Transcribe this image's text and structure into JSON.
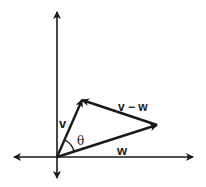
{
  "diagram": {
    "type": "vector-diagram",
    "colors": {
      "stroke": "#1a1a1a",
      "background": "#ffffff"
    },
    "axes": {
      "origin": [
        57,
        157
      ],
      "x_axis": {
        "left": 14,
        "right": 193
      },
      "y_axis": {
        "top": 12,
        "bottom": 178
      }
    },
    "vectors": [
      {
        "name": "v",
        "label": "v",
        "from": [
          57,
          157
        ],
        "to": [
          82,
          100
        ]
      },
      {
        "name": "w",
        "label": "w",
        "from": [
          57,
          157
        ],
        "to": [
          157,
          125
        ]
      },
      {
        "name": "v-w",
        "label": "v − w",
        "from": [
          157,
          125
        ],
        "to": [
          82,
          100
        ]
      }
    ],
    "angle": {
      "label": "θ",
      "between": [
        "v",
        "w"
      ]
    }
  }
}
